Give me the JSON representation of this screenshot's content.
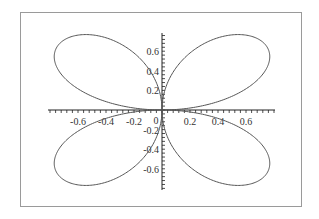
{
  "chart_data": {
    "type": "line",
    "title": "",
    "xlabel": "",
    "ylabel": "",
    "curve": {
      "kind": "polar",
      "r": "sin(2*theta)",
      "theta_range": [
        0,
        6.2832
      ],
      "samples": 720
    },
    "xlim": [
      -0.8,
      0.8
    ],
    "ylim": [
      -0.8,
      0.8
    ],
    "x_ticks": [
      {
        "value": -0.6,
        "label": "-0.6"
      },
      {
        "value": -0.4,
        "label": "-0.4"
      },
      {
        "value": -0.2,
        "label": "-0.2"
      },
      {
        "value": 0.2,
        "label": "0.2"
      },
      {
        "value": 0.4,
        "label": "0.4"
      },
      {
        "value": 0.6,
        "label": "0.6"
      }
    ],
    "y_ticks": [
      {
        "value": 0.6,
        "label": "0.6"
      },
      {
        "value": 0.4,
        "label": "0.4"
      },
      {
        "value": 0.2,
        "label": "0.2"
      },
      {
        "value": -0.2,
        "label": "-0.2"
      },
      {
        "value": -0.4,
        "label": "-0.4"
      },
      {
        "value": -0.6,
        "label": "-0.6"
      }
    ],
    "origin_label": "0",
    "grid": false,
    "legend": null,
    "line_color": "#555555",
    "axis_color": "#222222"
  }
}
